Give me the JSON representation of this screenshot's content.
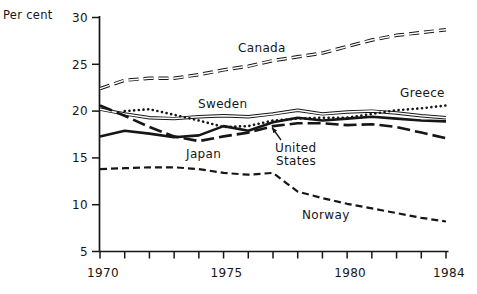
{
  "header": {
    "unit_label": "Per cent"
  },
  "colors": {
    "ink": "#161616",
    "background": "#ffffff"
  },
  "chart_data": {
    "type": "line",
    "title": "",
    "ylabel": "Per cent",
    "xlabel": "",
    "grid": false,
    "legend_position": "inline-labels",
    "ylim": [
      5,
      30
    ],
    "xlim": [
      1970,
      1984
    ],
    "y_ticks": [
      30,
      25,
      20,
      15,
      10,
      5
    ],
    "x_minor_ticks": [
      1970,
      1971,
      1972,
      1973,
      1974,
      1975,
      1976,
      1977,
      1978,
      1979,
      1980,
      1981,
      1982,
      1983,
      1984
    ],
    "x_tick_labels": [
      {
        "year": 1970,
        "text": "1970"
      },
      {
        "year": 1975,
        "text": "1975"
      },
      {
        "year": 1980,
        "text": "1980"
      },
      {
        "year": 1984,
        "text": "1984"
      }
    ],
    "series": [
      {
        "id": "canada",
        "name": "Canada",
        "style": "double-dash",
        "start_year": 1970,
        "values": [
          22.4,
          23.3,
          23.5,
          23.5,
          23.9,
          24.4,
          24.8,
          25.4,
          25.8,
          26.2,
          26.9,
          27.6,
          28.1,
          28.4,
          28.7
        ],
        "label": {
          "text": "Canada",
          "x": 238,
          "y": 52
        }
      },
      {
        "id": "sweden",
        "name": "Sweden",
        "style": "double-solid",
        "start_year": 1970,
        "values": [
          20.2,
          19.7,
          19.3,
          19.2,
          19.4,
          19.5,
          19.4,
          19.7,
          20.1,
          19.7,
          19.9,
          20.0,
          19.8,
          19.5,
          19.3
        ],
        "label": {
          "text": "Sweden",
          "x": 198,
          "y": 108
        }
      },
      {
        "id": "greece",
        "name": "Greece",
        "style": "dotted",
        "start_year": 1971,
        "values": [
          20.0,
          20.2,
          19.6,
          19.0,
          18.3,
          18.4,
          19.0,
          19.2,
          19.3,
          19.3,
          19.7,
          20.1,
          20.3,
          20.6
        ],
        "label": {
          "text": "Greece",
          "x": 400,
          "y": 97
        }
      },
      {
        "id": "united-states",
        "name": "United States",
        "style": "long-dash",
        "start_year": 1970,
        "values": [
          20.6,
          19.5,
          18.3,
          17.3,
          16.8,
          17.3,
          17.7,
          18.4,
          18.7,
          18.7,
          18.5,
          18.6,
          18.3,
          17.7,
          17.1
        ],
        "label": {
          "text": "United",
          "x": 275,
          "y": 152
        },
        "label2": {
          "text": "States",
          "x": 276,
          "y": 165
        },
        "pointer": {
          "x1": 281,
          "y1": 140,
          "x2": 272,
          "y2": 127.5
        }
      },
      {
        "id": "japan",
        "name": "Japan",
        "style": "solid",
        "start_year": 1970,
        "values": [
          17.3,
          17.9,
          17.6,
          17.2,
          17.4,
          18.4,
          17.9,
          18.8,
          19.3,
          19.0,
          19.2,
          19.4,
          19.2,
          19.0,
          18.9
        ],
        "label": {
          "text": "Japan",
          "x": 186,
          "y": 158
        }
      },
      {
        "id": "norway",
        "name": "Norway",
        "style": "dash",
        "start_year": 1970,
        "values": [
          13.8,
          13.9,
          14.0,
          14.0,
          13.8,
          13.4,
          13.2,
          13.4,
          11.4,
          10.7,
          10.1,
          9.6,
          9.1,
          8.6,
          8.2
        ],
        "label": {
          "text": "Norway",
          "x": 302,
          "y": 219
        }
      }
    ]
  }
}
